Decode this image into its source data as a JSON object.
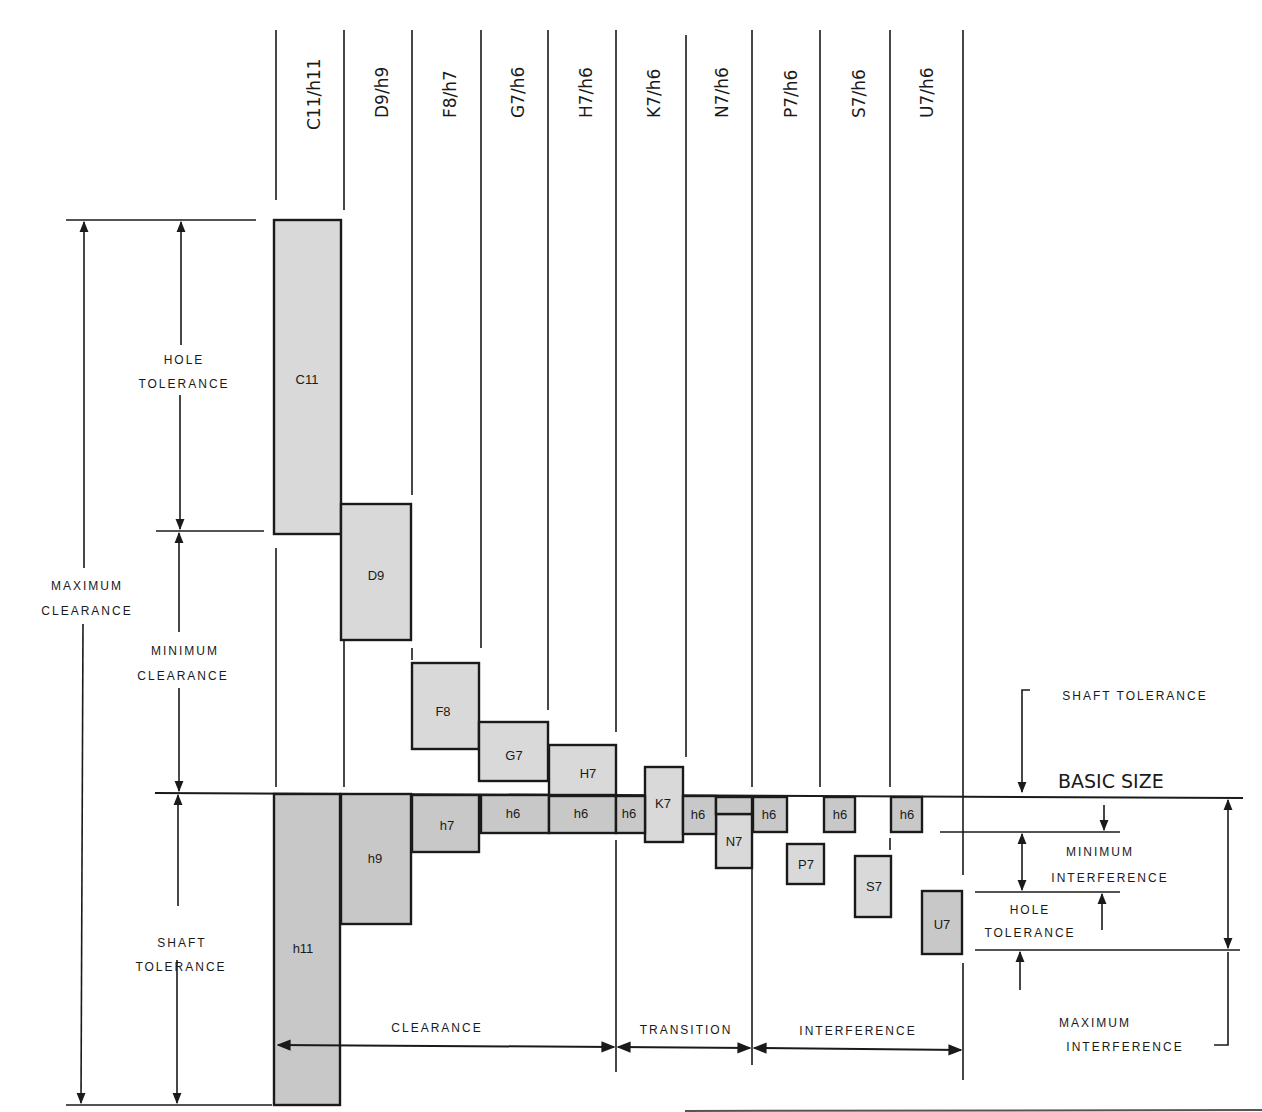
{
  "diagram": {
    "columns": [
      {
        "label": "C11/h11"
      },
      {
        "label": "D9/h9"
      },
      {
        "label": "F8/h7"
      },
      {
        "label": "G7/h6"
      },
      {
        "label": "H7/h6"
      },
      {
        "label": "K7/h6"
      },
      {
        "label": "N7/h6"
      },
      {
        "label": "P7/h6"
      },
      {
        "label": "S7/h6"
      },
      {
        "label": "U7/h6"
      }
    ],
    "holes": [
      "C11",
      "D9",
      "F8",
      "G7",
      "H7",
      "K7",
      "N7",
      "P7",
      "S7",
      "U7"
    ],
    "shafts": [
      "h11",
      "h9",
      "h7",
      "h6",
      "h6",
      "h6",
      "h6",
      "h6",
      "h6",
      "h6"
    ],
    "left_labels": {
      "hole_tol_1": "HOLE",
      "hole_tol_2": "TOLERANCE",
      "max_clear_1": "MAXIMUM",
      "max_clear_2": "CLEARANCE",
      "min_clear_1": "MINIMUM",
      "min_clear_2": "CLEARANCE",
      "shaft_tol_1": "SHAFT",
      "shaft_tol_2": "TOLERANCE"
    },
    "right_labels": {
      "shaft_tolerance": "SHAFT TOLERANCE",
      "basic_size": "BASIC SIZE",
      "min_int_1": "MINIMUM",
      "min_int_2": "INTERFERENCE",
      "hole_tol_1": "HOLE",
      "hole_tol_2": "TOLERANCE",
      "max_int_1": "MAXIMUM",
      "max_int_2": "INTERFERENCE"
    },
    "fit_ranges": {
      "clearance": "CLEARANCE",
      "transition": "TRANSITION",
      "interference": "INTERFERENCE"
    }
  }
}
